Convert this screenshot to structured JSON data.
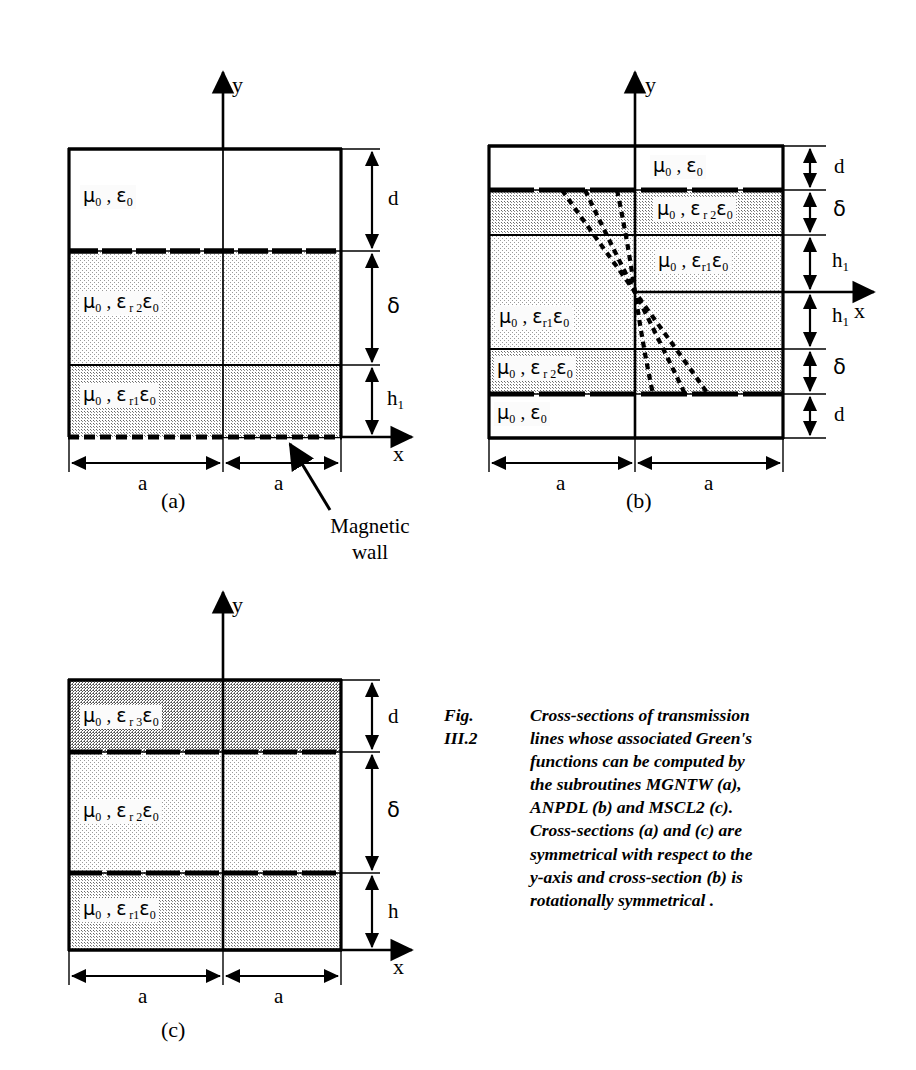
{
  "figure": {
    "number": "Fig. III.2",
    "caption": "Cross-sections of transmission\nlines whose associated Green's\nfunctions can be computed by\n the subroutines MGNTW (a),\n ANPDL (b) and MSCL2 (c).\nCross-sections (a) and (c) are\nsymmetrical with respect to the\ny-axis and cross-section (b) is\nrotationally symmetrical ."
  },
  "colors": {
    "ink": "#000000",
    "paper": "#ffffff",
    "fill_light": "#ececec",
    "fill_medium": "#d9d9d9",
    "fill_dark": "#c6c6c6"
  },
  "axes": {
    "x_label": "x",
    "y_label": "y"
  },
  "annotation": {
    "magnetic_wall_line1": "Magnetic",
    "magnetic_wall_line2": "wall"
  },
  "panels": [
    {
      "id": "a",
      "label": "(a)",
      "subroutine": "MGNTW",
      "width_labels": [
        "a",
        "a"
      ],
      "layers": [
        {
          "material": "μ0 , ε0",
          "mu": "μ",
          "mu_sub": "0",
          "eps": "ε",
          "eps_rsub": "",
          "eps_sub": "0",
          "thickness_label": "d",
          "fill": "none"
        },
        {
          "material": "μ0 , εr2ε0",
          "mu": "μ",
          "mu_sub": "0",
          "eps": "ε",
          "eps_rsub": "r 2",
          "eps_sub": "0",
          "thickness_label": "δ",
          "fill": "light"
        },
        {
          "material": "μ0 , εr1ε0",
          "mu": "μ",
          "mu_sub": "0",
          "eps": "ε",
          "eps_rsub": "r1",
          "eps_sub": "0",
          "thickness_label": "h1",
          "fill": "medium"
        }
      ],
      "boundaries": {
        "top": "solid",
        "mid1": "dashed-thick",
        "mid2": "solid",
        "bottom": "magnetic-wall"
      }
    },
    {
      "id": "b",
      "label": "(b)",
      "subroutine": "ANPDL",
      "width_labels": [
        "a",
        "a"
      ],
      "layers": [
        {
          "material": "μ0 , ε0",
          "mu": "μ",
          "mu_sub": "0",
          "eps": "ε",
          "eps_rsub": "",
          "eps_sub": "0",
          "thickness_label": "d",
          "fill": "none"
        },
        {
          "material": "μ0 , εr2ε0",
          "mu": "μ",
          "mu_sub": "0",
          "eps": "ε",
          "eps_rsub": "r 2",
          "eps_sub": "0",
          "thickness_label": "δ",
          "fill": "medium"
        },
        {
          "material": "μ0 , εr1ε0",
          "mu": "μ",
          "mu_sub": "0",
          "eps": "ε",
          "eps_rsub": "r1",
          "eps_sub": "0",
          "thickness_label": "h1",
          "fill": "light"
        },
        {
          "material": "μ0 , εr1ε0",
          "mu": "μ",
          "mu_sub": "0",
          "eps": "ε",
          "eps_rsub": "r1",
          "eps_sub": "0",
          "thickness_label": "h1",
          "fill": "light"
        },
        {
          "material": "μ0 , εr2ε0",
          "mu": "μ",
          "mu_sub": "0",
          "eps": "ε",
          "eps_rsub": "r 2",
          "eps_sub": "0",
          "thickness_label": "δ",
          "fill": "medium"
        },
        {
          "material": "μ0 , ε0",
          "mu": "μ",
          "mu_sub": "0",
          "eps": "ε",
          "eps_rsub": "",
          "eps_sub": "0",
          "thickness_label": "d",
          "fill": "none"
        }
      ],
      "field_lines": 3
    },
    {
      "id": "c",
      "label": "(c)",
      "subroutine": "MSCL2",
      "width_labels": [
        "a",
        "a"
      ],
      "layers": [
        {
          "material": "μ0 , εr3ε0",
          "mu": "μ",
          "mu_sub": "0",
          "eps": "ε",
          "eps_rsub": "r 3",
          "eps_sub": "0",
          "thickness_label": "d",
          "fill": "dark"
        },
        {
          "material": "μ0 , εr2ε0",
          "mu": "μ",
          "mu_sub": "0",
          "eps": "ε",
          "eps_rsub": "r 2",
          "eps_sub": "0",
          "thickness_label": "δ",
          "fill": "light"
        },
        {
          "material": "μ0 , εr1ε0",
          "mu": "μ",
          "mu_sub": "0",
          "eps": "ε",
          "eps_rsub": "r1",
          "eps_sub": "0",
          "thickness_label": "h",
          "fill": "medium"
        }
      ]
    }
  ]
}
